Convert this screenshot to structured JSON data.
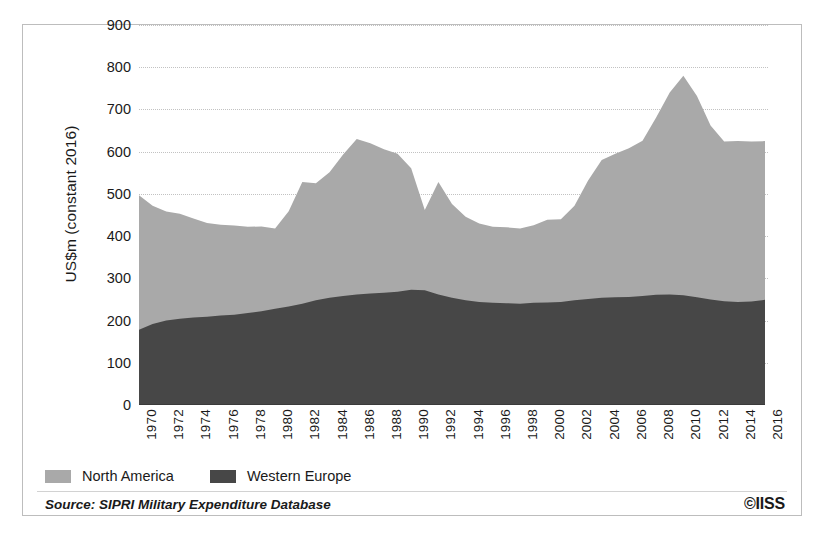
{
  "figure": {
    "y_axis_title": "US$m (constant 2016)",
    "source_note": "Source: SIPRI Military Expenditure Database",
    "copyright": "©IISS"
  },
  "legend": {
    "items": [
      {
        "label": "North America",
        "color": "#a9a9a9"
      },
      {
        "label": "Western Europe",
        "color": "#474747"
      }
    ]
  },
  "chart_data": {
    "type": "area",
    "stacked": true,
    "title": "",
    "xlabel": "",
    "ylabel": "US$m (constant 2016)",
    "ylim": [
      0,
      900
    ],
    "ytick_values": [
      0,
      100,
      200,
      300,
      400,
      500,
      600,
      700,
      800,
      900
    ],
    "ytick_labels": [
      "0",
      "100",
      "200",
      "300",
      "400",
      "500",
      "600",
      "700",
      "800",
      "900"
    ],
    "grid": "horizontal-dotted",
    "legend_position": "below-left",
    "xtick_labels": [
      "1970",
      "1972",
      "1974",
      "1976",
      "1978",
      "1980",
      "1982",
      "1984",
      "1986",
      "1988",
      "1990",
      "1992",
      "1994",
      "1996",
      "1998",
      "2000",
      "2002",
      "2004",
      "2006",
      "2008",
      "2010",
      "2012",
      "2014",
      "2016"
    ],
    "x": [
      1970,
      1971,
      1972,
      1973,
      1974,
      1975,
      1976,
      1977,
      1978,
      1979,
      1980,
      1981,
      1982,
      1983,
      1984,
      1985,
      1986,
      1987,
      1988,
      1989,
      1990,
      1991,
      1992,
      1993,
      1994,
      1995,
      1996,
      1997,
      1998,
      1999,
      2000,
      2001,
      2002,
      2003,
      2004,
      2005,
      2006,
      2007,
      2008,
      2009,
      2010,
      2011,
      2012,
      2013,
      2014,
      2015,
      2016
    ],
    "series": [
      {
        "name": "Western Europe",
        "color": "#474747",
        "values": [
          178,
          192,
          200,
          204,
          207,
          209,
          212,
          214,
          218,
          222,
          228,
          233,
          240,
          248,
          254,
          258,
          262,
          264,
          266,
          268,
          273,
          272,
          262,
          254,
          248,
          244,
          242,
          241,
          240,
          242,
          243,
          244,
          248,
          251,
          254,
          255,
          256,
          258,
          261,
          262,
          260,
          255,
          250,
          246,
          244,
          245,
          249
        ]
      },
      {
        "name": "North America",
        "color": "#a9a9a9",
        "values": [
          319,
          280,
          258,
          249,
          235,
          222,
          215,
          211,
          204,
          201,
          190,
          226,
          288,
          277,
          297,
          335,
          368,
          356,
          340,
          327,
          288,
          190,
          266,
          222,
          198,
          186,
          180,
          180,
          178,
          184,
          196,
          196,
          224,
          281,
          326,
          340,
          352,
          368,
          420,
          478,
          520,
          477,
          412,
          378,
          381,
          379,
          376
        ]
      }
    ],
    "totals": [
      497,
      472,
      458,
      453,
      442,
      431,
      427,
      425,
      422,
      423,
      418,
      459,
      528,
      525,
      551,
      593,
      630,
      620,
      606,
      595,
      561,
      462,
      528,
      476,
      446,
      430,
      422,
      421,
      418,
      426,
      439,
      440,
      472,
      532,
      580,
      595,
      608,
      626,
      681,
      740,
      780,
      732,
      662,
      624,
      625,
      624,
      625
    ]
  }
}
